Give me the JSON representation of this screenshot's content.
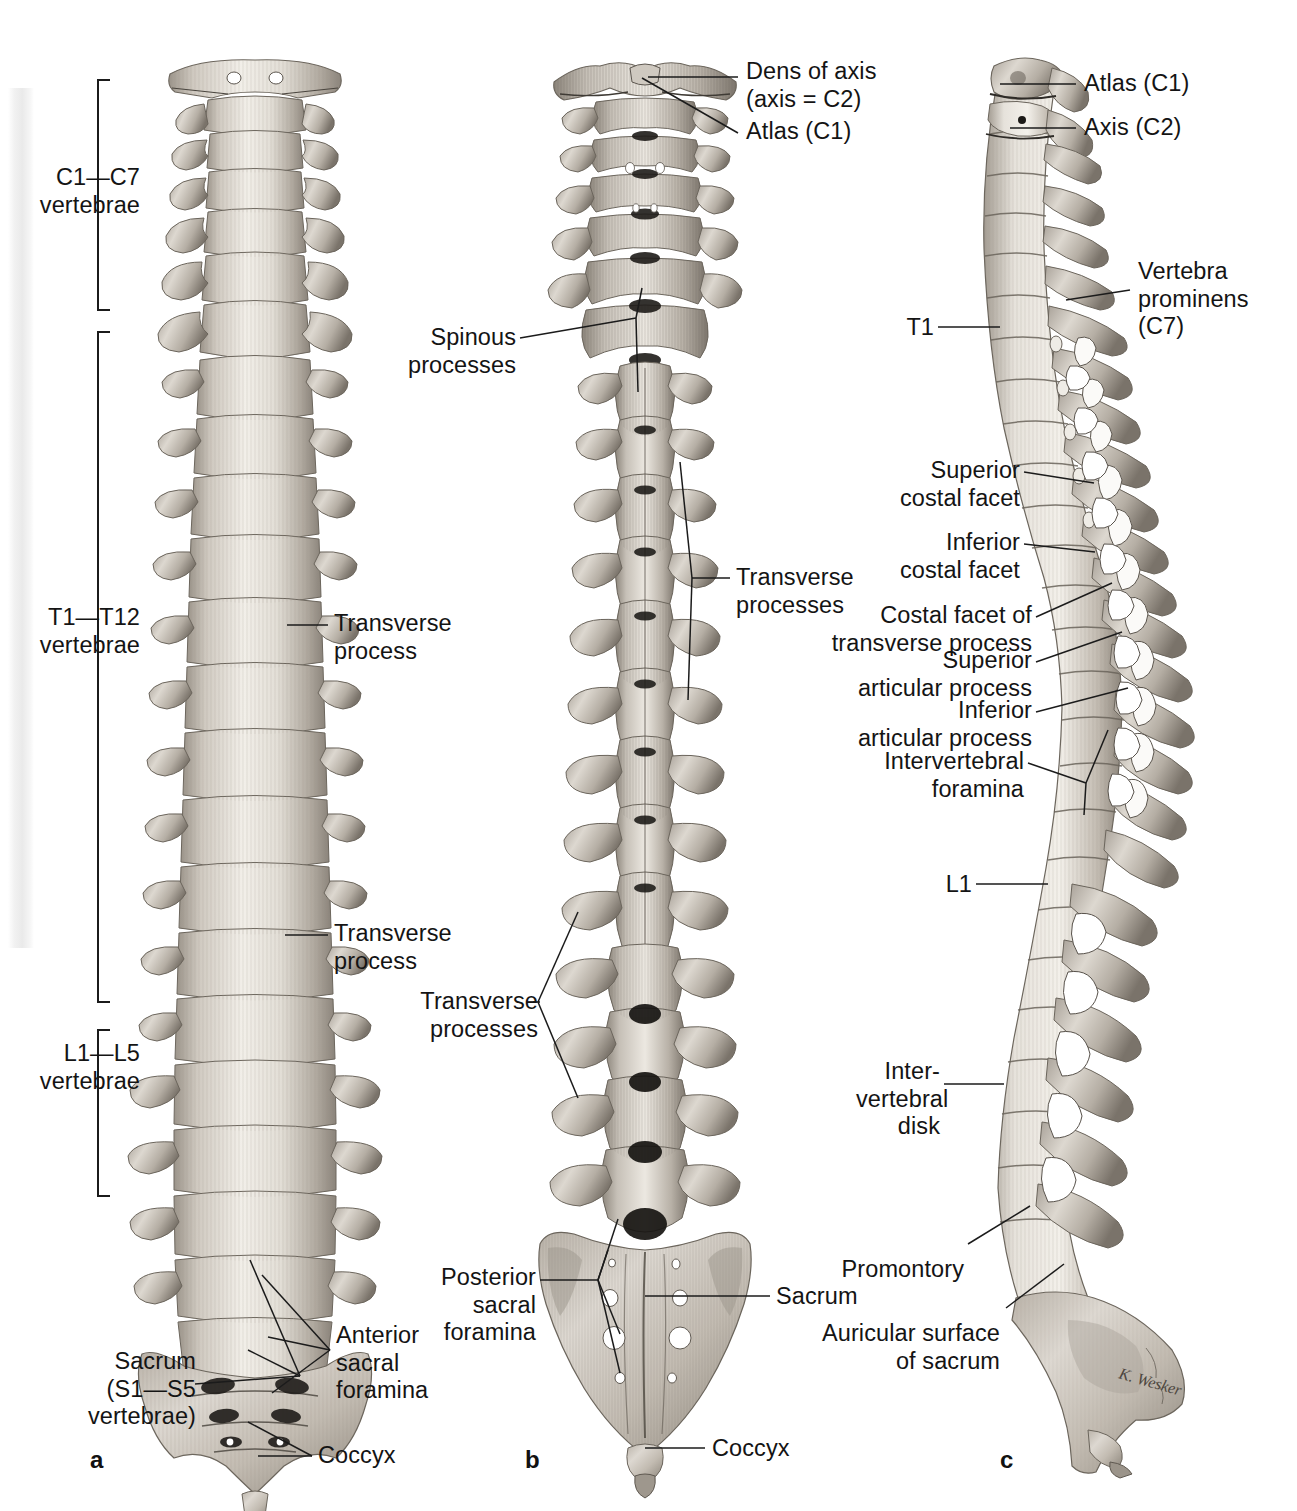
{
  "figure": {
    "kind": "anatomical-illustration",
    "style": "grayscale pencil rendering",
    "panels": [
      {
        "letter": "a",
        "view": "anterior view"
      },
      {
        "letter": "b",
        "view": "posterior view"
      },
      {
        "letter": "c",
        "view": "left lateral view"
      }
    ]
  },
  "panel_a": {
    "letter": "a",
    "brackets": [
      {
        "label": "C1—C7\nvertebrae"
      },
      {
        "label": "T1—T12\nvertebrae"
      },
      {
        "label": "L1—L5\nvertebrae"
      }
    ],
    "labels": {
      "transverse_process_thoracic": "Transverse\nprocess",
      "transverse_process_lumbar": "Transverse\nprocess",
      "sacrum": "Sacrum\n(S1—S5\nvertebrae)",
      "anterior_sacral_foramina": "Anterior\nsacral\nforamina",
      "coccyx": "Coccyx"
    }
  },
  "panel_b": {
    "letter": "b",
    "labels": {
      "dens_of_axis": "Dens of axis\n(axis = C2)",
      "atlas": "Atlas (C1)",
      "spinous_processes": "Spinous\nprocesses",
      "transverse_processes_thoracic": "Transverse\nprocesses",
      "transverse_processes_lumbar": "Transverse\nprocesses",
      "posterior_sacral_foramina": "Posterior\nsacral\nforamina",
      "sacrum": "Sacrum",
      "coccyx": "Coccyx"
    }
  },
  "panel_c": {
    "letter": "c",
    "labels": {
      "atlas": "Atlas (C1)",
      "axis": "Axis (C2)",
      "vertebra_prominens": "Vertebra\nprominens\n(C7)",
      "t1": "T1",
      "superior_costal_facet": "Superior\ncostal facet",
      "inferior_costal_facet": "Inferior\ncostal facet",
      "costal_facet_of_transverse_process": "Costal facet of\ntransverse process",
      "superior_articular_process": "Superior\narticular process",
      "inferior_articular_process": "Inferior\narticular process",
      "intervertebral_foramina": "Intervertebral\nforamina",
      "l1": "L1",
      "intervertebral_disk": "Inter-\nvertebral\ndisk",
      "promontory": "Promontory",
      "auricular_surface_of_sacrum": "Auricular surface\nof sacrum"
    },
    "signature": "K. Wesker"
  },
  "colors": {
    "bone_light": "#efebe5",
    "bone_mid": "#c9c3ba",
    "bone_dark": "#8d867c",
    "bone_shadow": "#5e5950",
    "ink": "#1b1b1b",
    "background": "#ffffff"
  }
}
